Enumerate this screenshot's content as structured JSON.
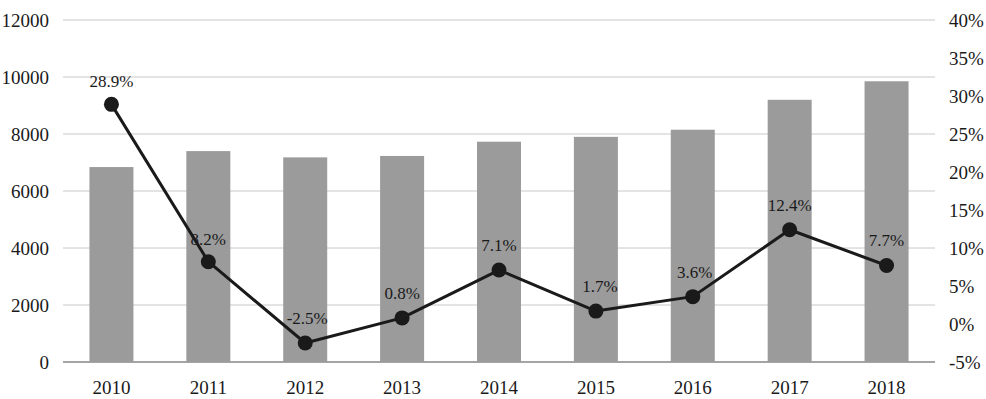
{
  "chart_data": {
    "type": "bar",
    "title": "",
    "subtitle": "",
    "xlabel": "",
    "ylabel": "",
    "y2label": "",
    "categories": [
      "2010",
      "2011",
      "2012",
      "2013",
      "2014",
      "2015",
      "2016",
      "2017",
      "2018"
    ],
    "series": [
      {
        "name": "Amount",
        "type": "bar",
        "axis": "left",
        "color": "#9b9b9b",
        "values": [
          6840,
          7400,
          7180,
          7230,
          7730,
          7900,
          8150,
          9200,
          9850
        ]
      },
      {
        "name": "Growth rate",
        "type": "line",
        "axis": "right",
        "color": "#1a1a1a",
        "values": [
          28.9,
          8.2,
          -2.5,
          0.8,
          7.1,
          1.7,
          3.6,
          12.4,
          7.7
        ],
        "data_labels": [
          "28.9%",
          "8.2%",
          "-2.5%",
          "0.8%",
          "7.1%",
          "1.7%",
          "3.6%",
          "12.4%",
          "7.7%"
        ]
      }
    ],
    "ylim": [
      0,
      12000
    ],
    "y2lim": [
      -5,
      40
    ],
    "yticks": [
      0,
      2000,
      4000,
      6000,
      8000,
      10000,
      12000
    ],
    "y2ticks": [
      -5,
      0,
      5,
      10,
      15,
      20,
      25,
      30,
      35,
      40
    ],
    "ytick_labels": [
      "0",
      "2000",
      "4000",
      "6000",
      "8000",
      "10000",
      "12000"
    ],
    "y2tick_labels": [
      "-5%",
      "0%",
      "5%",
      "10%",
      "15%",
      "20%",
      "25%",
      "30%",
      "35%",
      "40%"
    ],
    "grid": true,
    "grid_color": "#c8c8c8",
    "legend": "none",
    "background": "#ffffff"
  }
}
